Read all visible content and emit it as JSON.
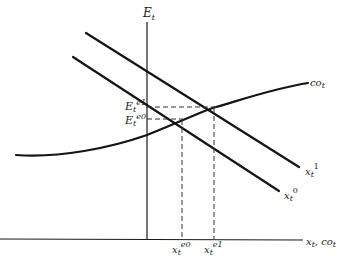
{
  "diagram": {
    "axes": {
      "y_label": "E",
      "y_label_sub": "t",
      "x_label": "x",
      "x_label_sub": "t",
      "x_label_sep": ", ",
      "x_label2": "co",
      "x_label2_sub": "t"
    },
    "curves": [
      {
        "name": "x_t^1",
        "label": "x",
        "sub": "t",
        "sup": "1",
        "type": "line"
      },
      {
        "name": "x_t^0",
        "label": "x",
        "sub": "t",
        "sup": "0",
        "type": "line"
      },
      {
        "name": "co_t",
        "label": "co",
        "sub": "t",
        "type": "curve"
      }
    ],
    "equilibria": {
      "e1_y": {
        "label": "E",
        "sub": "t",
        "sup": "e1"
      },
      "e0_y": {
        "label": "E",
        "sub": "t",
        "sup": "e0"
      },
      "e0_x": {
        "label": "x",
        "sub": "t",
        "sup": "e0"
      },
      "e1_x": {
        "label": "x",
        "sub": "t",
        "sup": "e1"
      }
    },
    "colors": {
      "line": "#141414",
      "background": "#ffffff"
    }
  }
}
